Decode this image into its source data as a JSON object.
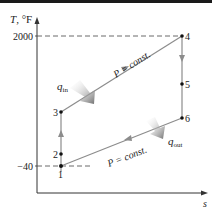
{
  "diagram": {
    "type": "T-s diagram",
    "axes": {
      "y_label_var": "T",
      "y_label_unit": ", °F",
      "x_label": "s",
      "y_ticks": [
        {
          "label": "2000",
          "y": 36
        },
        {
          "label": "−40",
          "y": 166
        }
      ]
    },
    "points": [
      {
        "id": "1",
        "label": "1",
        "x": 61,
        "y": 166
      },
      {
        "id": "2",
        "label": "2",
        "x": 61,
        "y": 154
      },
      {
        "id": "3",
        "label": "3",
        "x": 61,
        "y": 112
      },
      {
        "id": "4",
        "label": "4",
        "x": 182,
        "y": 36
      },
      {
        "id": "5",
        "label": "5",
        "x": 182,
        "y": 84
      },
      {
        "id": "6",
        "label": "6",
        "x": 182,
        "y": 118
      }
    ],
    "process_labels": {
      "upper": "P = const.",
      "lower": "P = const."
    },
    "heat": {
      "in_var": "q",
      "in_sub": "in",
      "out_var": "q",
      "out_sub": "out"
    },
    "colors": {
      "process_line": "#8c8c8c",
      "axis": "#333333",
      "point": "#111111",
      "heat_arrow": "#7a7a7a"
    }
  }
}
